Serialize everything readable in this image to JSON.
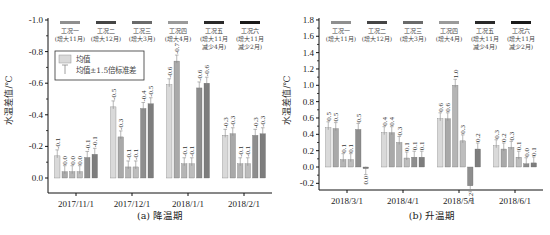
{
  "legend_cases": [
    {
      "name": "工况一",
      "desc1": "(增大11月)",
      "desc2": "",
      "color": "#8f8f8f"
    },
    {
      "name": "工况二",
      "desc1": "(增大12月)",
      "desc2": "",
      "color": "#454545"
    },
    {
      "name": "工况三",
      "desc1": "(增大3月)",
      "desc2": "",
      "color": "#6a6a6a"
    },
    {
      "name": "工况四",
      "desc1": "(增大4月)",
      "desc2": "",
      "color": "#9a9a9a"
    },
    {
      "name": "工况五",
      "desc1": "(增大11月",
      "desc2": "减少4月)",
      "color": "#2a2a2a"
    },
    {
      "name": "工况六",
      "desc1": "(增大11月",
      "desc2": "减少2月)",
      "color": "#1a1a1a"
    }
  ],
  "bar_colors": [
    "#d9d9d9",
    "#a9a9a9",
    "#b5b5b5",
    "#bdbdbd",
    "#8e8e8e",
    "#7d7d7d"
  ],
  "stat_legend": {
    "mean": "均值",
    "err": "均值±1.5倍标准差"
  },
  "chart_data": [
    {
      "type": "bar",
      "title": "(a) 降温期",
      "xlabel": "",
      "ylabel": "水温差值/℃",
      "ylim": [
        0.0,
        -1.0
      ],
      "y_inverted": true,
      "yticks": [
        "-1.0",
        "-0.8",
        "-0.6",
        "-0.4",
        "-0.2",
        "0.0"
      ],
      "categories": [
        "2017/11/1",
        "2017/12/1",
        "2018/1/1",
        "2018/2/1"
      ],
      "series": [
        {
          "name": "工况一",
          "values": [
            -0.14,
            -0.45,
            -0.59,
            -0.27
          ],
          "labels": [
            "-0.1",
            "-0.5",
            "-0.6",
            "-0.3"
          ]
        },
        {
          "name": "工况二",
          "values": [
            -0.04,
            -0.26,
            -0.74,
            -0.28
          ],
          "labels": [
            "0.0",
            "-0.3",
            "-0.7",
            "-0.3"
          ]
        },
        {
          "name": "工况三",
          "values": [
            -0.04,
            -0.07,
            -0.09,
            -0.09
          ],
          "labels": [
            "0.0",
            "-0.1",
            "-0.1",
            "-0.1"
          ]
        },
        {
          "name": "工况四",
          "values": [
            -0.04,
            -0.07,
            -0.09,
            -0.09
          ],
          "labels": [
            "0.0",
            "-0.1",
            "-0.1",
            "-0.1"
          ]
        },
        {
          "name": "工况五",
          "values": [
            -0.13,
            -0.44,
            -0.57,
            -0.27
          ],
          "labels": [
            "-0.1",
            "-0.4",
            "-0.6",
            "-0.3"
          ]
        },
        {
          "name": "工况六",
          "values": [
            -0.15,
            -0.47,
            -0.6,
            -0.28
          ],
          "labels": [
            "-0.1",
            "-0.5",
            "-0.6",
            "-0.3"
          ]
        }
      ]
    },
    {
      "type": "bar",
      "title": "(b) 升温期",
      "xlabel": "",
      "ylabel": "水温差值/℃",
      "ylim": [
        -0.2,
        1.8
      ],
      "yticks": [
        "1.8",
        "1.6",
        "1.4",
        "1.2",
        "1.0",
        "0.8",
        "0.6",
        "0.4",
        "0.2",
        "0.0",
        "-0.2"
      ],
      "categories": [
        "2018/3/1",
        "2018/4/1",
        "2018/5/1",
        "2018/6/1"
      ],
      "series": [
        {
          "name": "工况一",
          "values": [
            0.48,
            0.42,
            0.59,
            0.26
          ],
          "labels": [
            "0.5",
            "0.4",
            "0.6",
            "0.3"
          ]
        },
        {
          "name": "工况二",
          "values": [
            0.47,
            0.42,
            0.59,
            0.22
          ],
          "labels": [
            "0.5",
            "0.4",
            "0.6",
            "0.2"
          ]
        },
        {
          "name": "工况三",
          "values": [
            0.09,
            0.3,
            1.0,
            0.24
          ],
          "labels": [
            "0.1",
            "0.3",
            "1.0",
            "0.3"
          ]
        },
        {
          "name": "工况四",
          "values": [
            0.09,
            0.11,
            0.32,
            0.12
          ],
          "labels": [
            "0.1",
            "0.1",
            "0.3",
            "0.1"
          ]
        },
        {
          "name": "工况五",
          "values": [
            0.46,
            0.12,
            -0.23,
            0.04
          ],
          "labels": [
            "0.5",
            "0.1",
            "-0.2",
            "0.0"
          ]
        },
        {
          "name": "工况六",
          "values": [
            -0.02,
            0.12,
            0.22,
            0.05
          ],
          "labels": [
            "0.0",
            "0.1",
            "0.2",
            "0.1"
          ]
        }
      ]
    }
  ]
}
